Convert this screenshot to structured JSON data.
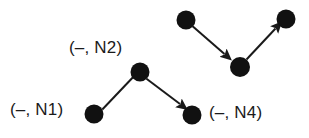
{
  "diagram": {
    "background_color": "#ffffff",
    "node_color": "#111111",
    "edge_color": "#1a1a1a",
    "label_color": "#1a1a1a",
    "width": 309,
    "height": 138,
    "clusters": [
      {
        "name": "left-cluster",
        "nodes": [
          {
            "id": "N1",
            "cx": 94,
            "cy": 114,
            "r": 9.5,
            "label": "(–, N1)"
          },
          {
            "id": "N2",
            "cx": 140,
            "cy": 72,
            "r": 9.5,
            "label": "(–, N2)"
          },
          {
            "id": "N4",
            "cx": 192,
            "cy": 115,
            "r": 9.5,
            "label": "(–, N4)"
          }
        ],
        "edges": [
          {
            "from": "N1",
            "to": "N2",
            "arrow": false
          },
          {
            "from": "N2",
            "to": "N4",
            "arrow": true
          }
        ]
      },
      {
        "name": "right-cluster",
        "nodes": [
          {
            "id": "R1",
            "cx": 186,
            "cy": 20,
            "r": 9.5,
            "label": ""
          },
          {
            "id": "R2",
            "cx": 240,
            "cy": 67,
            "r": 10.0,
            "label": ""
          },
          {
            "id": "R3",
            "cx": 286,
            "cy": 19,
            "r": 9.5,
            "label": ""
          }
        ],
        "edges": [
          {
            "from": "R1",
            "to": "R2",
            "arrow": true
          },
          {
            "from": "R2",
            "to": "R3",
            "arrow": true
          }
        ]
      }
    ],
    "labels": [
      {
        "name": "label-n2",
        "text": "(–, N2)",
        "x": 69,
        "y": 38
      },
      {
        "name": "label-n1",
        "text": "(–, N1)",
        "x": 10,
        "y": 100
      },
      {
        "name": "label-n4",
        "text": "(–, N4)",
        "x": 209,
        "y": 103
      }
    ]
  }
}
